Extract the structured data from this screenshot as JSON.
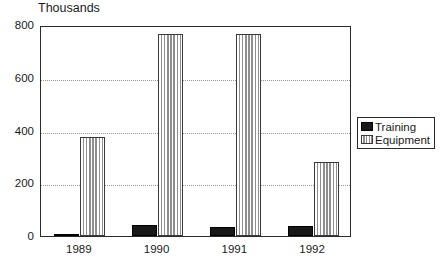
{
  "chart_data": {
    "type": "bar",
    "title": "Thousands",
    "xlabel": "",
    "ylabel": "",
    "categories": [
      "1989",
      "1990",
      "1991",
      "1992"
    ],
    "series": [
      {
        "name": "Training",
        "color": "#181818",
        "fill": "solid",
        "values": [
          8,
          40,
          33,
          38
        ]
      },
      {
        "name": "Equipment",
        "color": "#d4d4d4",
        "fill": "vertical-hatch",
        "values": [
          375,
          765,
          765,
          280
        ]
      }
    ],
    "ylim": [
      0,
      800
    ],
    "yticks": [
      0,
      200,
      400,
      600,
      800
    ],
    "ytick_labels": [
      "0",
      "200",
      "400",
      "600",
      "800"
    ],
    "gridlines": [
      200,
      400,
      600
    ],
    "grid": true,
    "grid_style": "dotted",
    "legend": {
      "position": "right",
      "entries": [
        {
          "label": "Training"
        },
        {
          "label": "Equipment"
        }
      ]
    }
  }
}
